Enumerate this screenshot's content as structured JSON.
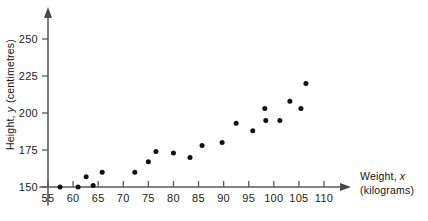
{
  "chart_data": {
    "type": "scatter",
    "title": "",
    "xlabel": "Weight, x (kilograms)",
    "ylabel": "Height, y (centimetres)",
    "xlabel_name": "Weight,",
    "xlabel_var": "x",
    "xlabel_unit": "(kilograms)",
    "ylabel_name": "Height,",
    "ylabel_var": "y",
    "ylabel_unit": "(centimetres)",
    "xlim": [
      55,
      112
    ],
    "ylim": [
      150,
      258
    ],
    "xticks": [
      55,
      60,
      65,
      70,
      75,
      80,
      85,
      90,
      95,
      100,
      105,
      110
    ],
    "yticks": [
      150,
      175,
      200,
      225,
      250
    ],
    "xtick_labels": [
      "55",
      "60",
      "65",
      "70",
      "75",
      "80",
      "85",
      "90",
      "95",
      "100",
      "105",
      "110"
    ],
    "ytick_labels": [
      "150",
      "175",
      "200",
      "225",
      "250"
    ],
    "grid": false,
    "legend": null,
    "marker": "filled-circle",
    "marker_color": "#111111",
    "axis_color": "#5a5a5a",
    "points": [
      {
        "x": 57.4,
        "y": 150
      },
      {
        "x": 61.0,
        "y": 150
      },
      {
        "x": 62.6,
        "y": 157
      },
      {
        "x": 64.0,
        "y": 151
      },
      {
        "x": 65.8,
        "y": 160
      },
      {
        "x": 72.3,
        "y": 160
      },
      {
        "x": 75.0,
        "y": 167
      },
      {
        "x": 76.5,
        "y": 174
      },
      {
        "x": 80.0,
        "y": 173
      },
      {
        "x": 83.3,
        "y": 170
      },
      {
        "x": 85.7,
        "y": 178
      },
      {
        "x": 89.7,
        "y": 180
      },
      {
        "x": 92.5,
        "y": 193
      },
      {
        "x": 95.8,
        "y": 188
      },
      {
        "x": 98.2,
        "y": 203
      },
      {
        "x": 98.4,
        "y": 195
      },
      {
        "x": 101.2,
        "y": 195
      },
      {
        "x": 103.2,
        "y": 208
      },
      {
        "x": 105.4,
        "y": 203
      },
      {
        "x": 106.4,
        "y": 220
      }
    ]
  }
}
